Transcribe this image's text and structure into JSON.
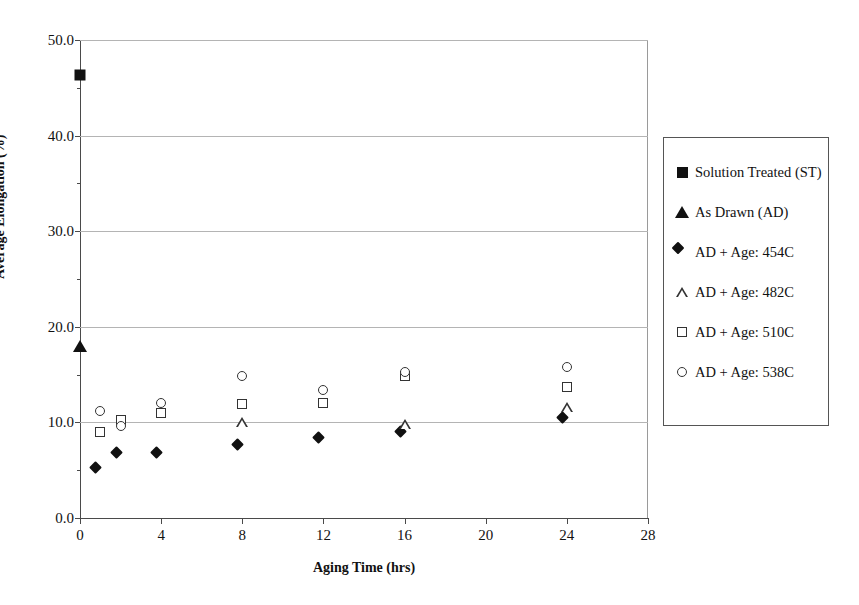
{
  "chart_data": {
    "type": "scatter",
    "title": "",
    "xlabel": "Aging Time (hrs)",
    "ylabel": "Average Elongation (%)",
    "xlim": [
      0,
      28
    ],
    "ylim": [
      0.0,
      50.0
    ],
    "xticks": [
      "0",
      "4",
      "8",
      "12",
      "16",
      "20",
      "24",
      "28"
    ],
    "xtick_values": [
      0,
      4,
      8,
      12,
      16,
      20,
      24,
      28
    ],
    "yticks": [
      "0.0",
      "10.0",
      "20.0",
      "30.0",
      "40.0",
      "50.0"
    ],
    "ytick_values": [
      0,
      10,
      20,
      30,
      40,
      50
    ],
    "y_minor_ticks": [
      5,
      15,
      25,
      35,
      45
    ],
    "grid": "horizontal",
    "legend_position": "right-outside",
    "series": [
      {
        "name": "Solution Treated (ST)",
        "marker": "filled-square",
        "points": [
          {
            "x": 0,
            "y": 46.3
          }
        ]
      },
      {
        "name": "As Drawn (AD)",
        "marker": "filled-triangle",
        "points": [
          {
            "x": 0,
            "y": 18.0
          }
        ]
      },
      {
        "name": "AD + Age: 454C",
        "marker": "filled-diamond",
        "points": [
          {
            "x": 1,
            "y": 4.8
          },
          {
            "x": 2,
            "y": 6.4
          },
          {
            "x": 4,
            "y": 6.4
          },
          {
            "x": 8,
            "y": 7.2
          },
          {
            "x": 12,
            "y": 7.9
          },
          {
            "x": 16,
            "y": 8.6
          },
          {
            "x": 24,
            "y": 10.0
          }
        ]
      },
      {
        "name": "AD + Age: 482C",
        "marker": "open-triangle",
        "points": [
          {
            "x": 8,
            "y": 10.0
          },
          {
            "x": 16,
            "y": 9.8
          },
          {
            "x": 24,
            "y": 11.6
          }
        ]
      },
      {
        "name": "AD + Age: 510C",
        "marker": "open-square",
        "points": [
          {
            "x": 1,
            "y": 9.0
          },
          {
            "x": 2,
            "y": 10.2
          },
          {
            "x": 4,
            "y": 11.0
          },
          {
            "x": 8,
            "y": 11.9
          },
          {
            "x": 12,
            "y": 12.0
          },
          {
            "x": 16,
            "y": 14.9
          },
          {
            "x": 24,
            "y": 13.7
          }
        ]
      },
      {
        "name": "AD + Age: 538C",
        "marker": "open-circle",
        "points": [
          {
            "x": 1,
            "y": 11.2
          },
          {
            "x": 2,
            "y": 9.6
          },
          {
            "x": 4,
            "y": 12.0
          },
          {
            "x": 8,
            "y": 14.9
          },
          {
            "x": 12,
            "y": 13.4
          },
          {
            "x": 16,
            "y": 15.3
          },
          {
            "x": 24,
            "y": 15.8
          }
        ]
      }
    ]
  },
  "legend": {
    "items": [
      {
        "label": "Solution Treated (ST)",
        "marker": "filled-square"
      },
      {
        "label": "As Drawn (AD)",
        "marker": "filled-triangle"
      },
      {
        "label": "AD + Age: 454C",
        "marker": "filled-diamond"
      },
      {
        "label": "AD + Age: 482C",
        "marker": "open-triangle"
      },
      {
        "label": "AD + Age: 510C",
        "marker": "open-square"
      },
      {
        "label": "AD + Age: 538C",
        "marker": "open-circle"
      }
    ]
  },
  "colors": {
    "marker": "#111111",
    "gridline": "#b4b4b4",
    "axis": "#4a4a4a",
    "frame": "#9a9a9a",
    "background": "#ffffff"
  }
}
